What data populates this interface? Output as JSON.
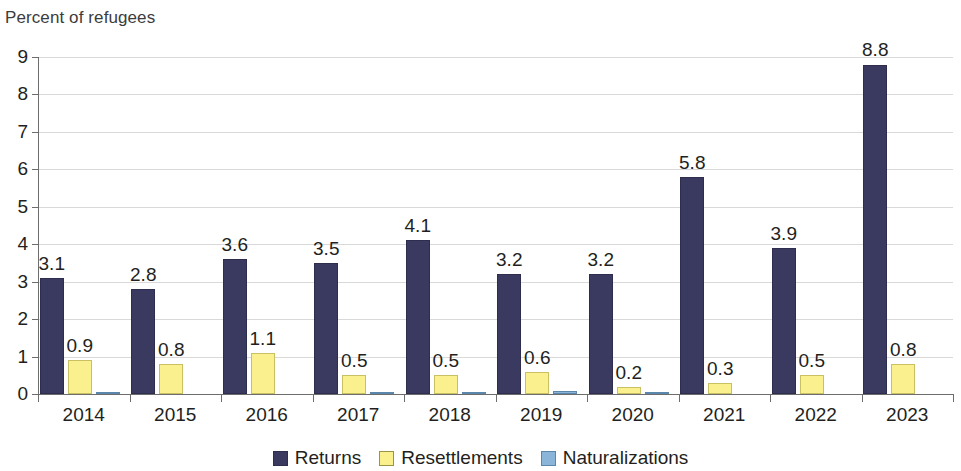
{
  "chart_data": {
    "type": "bar",
    "title": "Percent of refugees",
    "xlabel": "",
    "ylabel": "",
    "ylim": [
      0,
      9
    ],
    "ytick_labels": [
      "0",
      "1",
      "2",
      "3",
      "4",
      "5",
      "6",
      "7",
      "8",
      "9"
    ],
    "grid": true,
    "legend_position": "bottom-center",
    "categories": [
      "2014",
      "2015",
      "2016",
      "2017",
      "2018",
      "2019",
      "2020",
      "2021",
      "2022",
      "2023"
    ],
    "series": [
      {
        "name": "Returns",
        "color": "#3a3960",
        "values": [
          3.1,
          2.8,
          3.6,
          3.5,
          4.1,
          3.2,
          3.2,
          5.8,
          3.9,
          8.8
        ],
        "labels": [
          "3.1",
          "2.8",
          "3.6",
          "3.5",
          "4.1",
          "3.2",
          "3.2",
          "5.8",
          "3.9",
          "8.8"
        ]
      },
      {
        "name": "Resettlements",
        "color": "#fbf08e",
        "values": [
          0.9,
          0.8,
          1.1,
          0.5,
          0.5,
          0.6,
          0.2,
          0.3,
          0.5,
          0.8
        ],
        "labels": [
          "0.9",
          "0.8",
          "1.1",
          "0.5",
          "0.5",
          "0.6",
          "0.2",
          "0.3",
          "0.5",
          "0.8"
        ]
      },
      {
        "name": "Naturalizations",
        "color": "#8ab4d8",
        "values": [
          0.05,
          0.0,
          0.0,
          0.03,
          0.05,
          0.09,
          0.02,
          0.0,
          0.0,
          0.0
        ],
        "labels": [
          "",
          "",
          "",
          "",
          "",
          "",
          "",
          "",
          "",
          ""
        ]
      }
    ]
  },
  "legend": {
    "items": [
      {
        "label": "Returns",
        "key": "returns"
      },
      {
        "label": "Resettlements",
        "key": "resettlements"
      },
      {
        "label": "Naturalizations",
        "key": "naturalizations"
      }
    ]
  }
}
